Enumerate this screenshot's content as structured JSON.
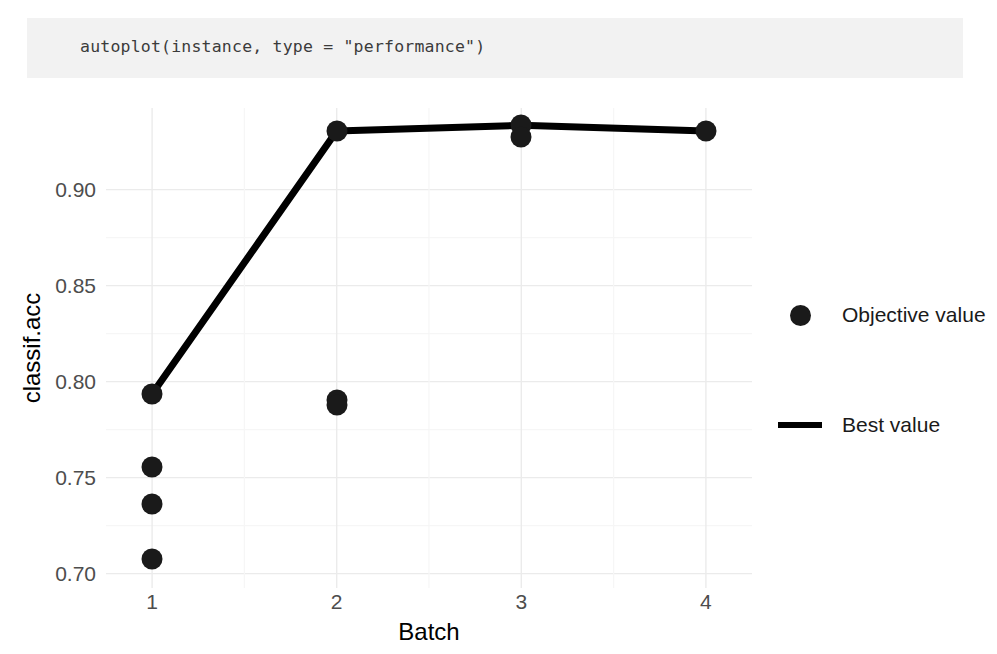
{
  "code_cell": {
    "text": "autoplot(instance, type = \"performance\")",
    "background": "#f2f2f2",
    "text_color": "#3b3b3b"
  },
  "chart_data": {
    "type": "scatter",
    "title": "",
    "xlabel": "Batch",
    "ylabel": "classif.acc",
    "xlim": [
      0.75,
      4.25
    ],
    "ylim": [
      0.6925,
      0.9425
    ],
    "xticks": [
      "1",
      "2",
      "3",
      "4"
    ],
    "xtick_values": [
      1,
      2,
      3,
      4
    ],
    "yticks": [
      "0.90",
      "0.85",
      "0.80",
      "0.75",
      "0.70"
    ],
    "ytick_values": [
      0.9,
      0.85,
      0.8,
      0.75,
      0.7
    ],
    "grid": true,
    "legend_position": "right",
    "series": [
      {
        "name": "Objective value",
        "type": "scatter",
        "marker": "circle",
        "color": "#1a1a1a",
        "points": [
          {
            "x": 1,
            "y": 0.7935
          },
          {
            "x": 1,
            "y": 0.7555
          },
          {
            "x": 1,
            "y": 0.736
          },
          {
            "x": 1,
            "y": 0.7075
          },
          {
            "x": 2,
            "y": 0.9305
          },
          {
            "x": 2,
            "y": 0.7905
          },
          {
            "x": 2,
            "y": 0.788
          },
          {
            "x": 3,
            "y": 0.9335
          },
          {
            "x": 3,
            "y": 0.9275
          },
          {
            "x": 4,
            "y": 0.9305
          }
        ]
      },
      {
        "name": "Best value",
        "type": "line",
        "color": "#000000",
        "x": [
          1,
          2,
          3,
          4
        ],
        "values": [
          0.7935,
          0.9305,
          0.9335,
          0.9305
        ]
      }
    ]
  },
  "legend": {
    "entries": [
      {
        "label": "Objective value",
        "key": "dot"
      },
      {
        "label": "Best value",
        "key": "line"
      }
    ]
  }
}
